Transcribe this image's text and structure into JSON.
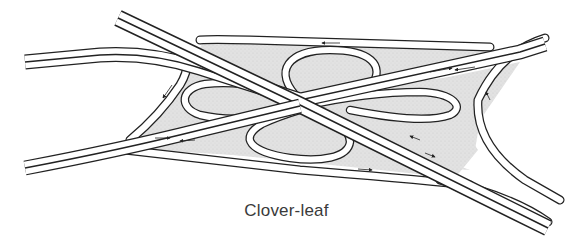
{
  "figure": {
    "title": "Clover-leaf",
    "type": "highway interchange illustration",
    "elements": [
      "main-road-a",
      "main-road-b",
      "loop-ramp-top",
      "loop-ramp-left",
      "loop-ramp-right",
      "loop-ramp-bottom",
      "outer-connector-roads",
      "direction-arrows",
      "shaded-infield"
    ],
    "colors": {
      "line": "#222222",
      "road": "#ffffff",
      "infield": "#dcdcdc",
      "caption": "#3a3a3a"
    }
  }
}
